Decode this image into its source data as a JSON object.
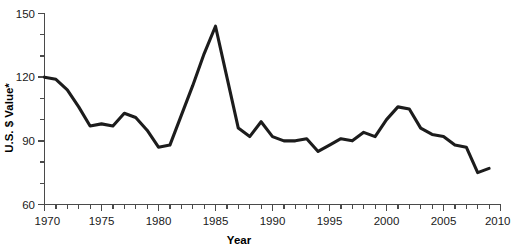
{
  "chart_data": {
    "type": "line",
    "title": "",
    "xlabel": "Year",
    "ylabel": "U.S. $ Value*",
    "xlim": [
      1970,
      2010
    ],
    "ylim": [
      60,
      150
    ],
    "grid": false,
    "legend": "none",
    "line_color": "#1c1c1c",
    "x_ticks_major": [
      1970,
      1975,
      1980,
      1985,
      1990,
      1995,
      2000,
      2005,
      2010
    ],
    "x_tick_labels": [
      "1970",
      "1975",
      "1980",
      "1985",
      "1990",
      "1995",
      "2000",
      "2005",
      "2010"
    ],
    "x_tick_minor_step": 1,
    "y_ticks_major": [
      60,
      90,
      120,
      150
    ],
    "y_tick_labels": [
      "60",
      "90",
      "120",
      "150"
    ],
    "y_tick_minor_step": 10,
    "x": [
      1970,
      1971,
      1972,
      1973,
      1974,
      1975,
      1976,
      1977,
      1978,
      1979,
      1980,
      1981,
      1982,
      1983,
      1984,
      1985,
      1986,
      1987,
      1988,
      1989,
      1990,
      1991,
      1992,
      1993,
      1994,
      1995,
      1996,
      1997,
      1998,
      1999,
      2000,
      2001,
      2002,
      2003,
      2004,
      2005,
      2006,
      2007,
      2008,
      2009
    ],
    "values": [
      120,
      119,
      114,
      106,
      97,
      98,
      97,
      103,
      101,
      95,
      87,
      88,
      102,
      116,
      131,
      144,
      120,
      96,
      92,
      99,
      92,
      90,
      90,
      91,
      85,
      88,
      91,
      90,
      94,
      92,
      100,
      106,
      105,
      96,
      93,
      92,
      88,
      87,
      75,
      77
    ]
  },
  "axis": {
    "y_label": "U.S. $ Value*",
    "x_label": "Year"
  }
}
